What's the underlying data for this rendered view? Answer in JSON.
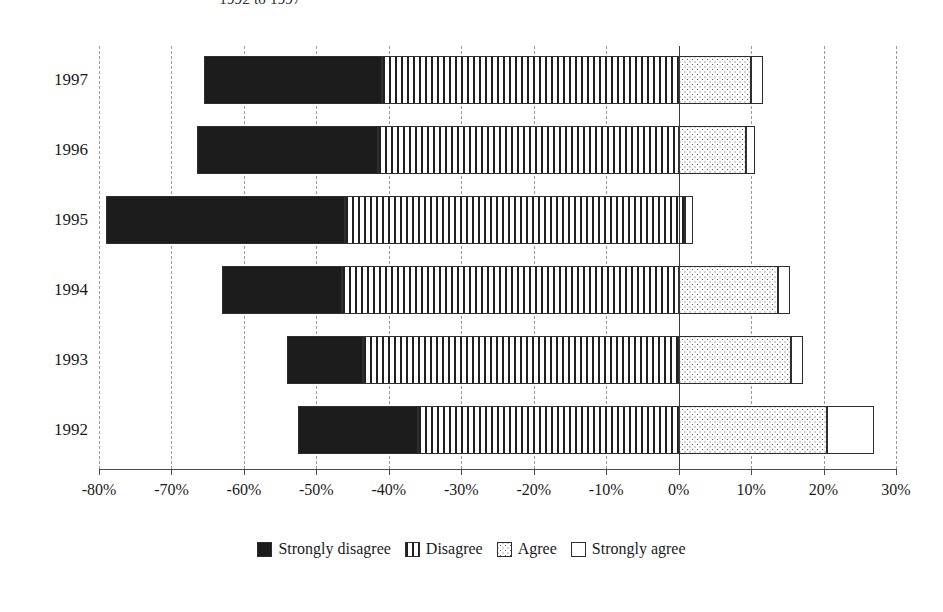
{
  "chart_data": {
    "type": "bar",
    "orientation": "horizontal",
    "stacked": true,
    "diverging": true,
    "title": "1992 to 1997",
    "xlabel": "",
    "ylabel": "",
    "xlim": [
      -80,
      30
    ],
    "xtick_step": 10,
    "grid": true,
    "legend_position": "bottom",
    "categories": [
      "1992",
      "1993",
      "1994",
      "1995",
      "1996",
      "1997"
    ],
    "category_order_top_to_bottom": [
      "1997",
      "1996",
      "1995",
      "1994",
      "1993",
      "1992"
    ],
    "x_tick_labels": [
      "-80%",
      "-70%",
      "-60%",
      "-50%",
      "-40%",
      "-30%",
      "-20%",
      "-10%",
      "0%",
      "10%",
      "20%",
      "30%"
    ],
    "x_tick_values": [
      -80,
      -70,
      -60,
      -50,
      -40,
      -30,
      -20,
      -10,
      0,
      10,
      20,
      30
    ],
    "series": [
      {
        "name": "Strongly disagree",
        "pattern": "solid-black",
        "color": "#1c1c1c",
        "values": [
          -16.5,
          -10.5,
          -16.5,
          -33.0,
          -25.0,
          -24.0
        ]
      },
      {
        "name": "Disagree",
        "pattern": "vertical-stripes",
        "color": "#ffffff",
        "values": [
          -36.0,
          -43.5,
          -46.5,
          -46.0,
          -41.5,
          -41.0
        ]
      },
      {
        "name": "Agree",
        "pattern": "dotted",
        "color": "#fdfdfd",
        "values": [
          20.5,
          15.5,
          13.7,
          0.9,
          9.3,
          10.0
        ]
      },
      {
        "name": "Strongly agree",
        "pattern": "white",
        "color": "#ffffff",
        "values": [
          6.5,
          1.7,
          1.7,
          1.1,
          1.2,
          1.6
        ]
      }
    ],
    "rows": [
      {
        "year": "1997",
        "negative_start": -65.5,
        "strongly_disagree_end": -41.0,
        "disagree_end": 0,
        "agree_end": 10.0,
        "strongly_agree_end": 11.6
      },
      {
        "year": "1996",
        "negative_start": -66.5,
        "strongly_disagree_end": -41.5,
        "disagree_end": 0,
        "agree_end": 9.3,
        "strongly_agree_end": 10.5
      },
      {
        "year": "1995",
        "negative_start": -79.0,
        "strongly_disagree_end": -46.0,
        "disagree_end": 0.9,
        "agree_end": 0.9,
        "strongly_agree_end": 2.0
      },
      {
        "year": "1994",
        "negative_start": -63.0,
        "strongly_disagree_end": -46.5,
        "disagree_end": 0,
        "agree_end": 13.7,
        "strongly_agree_end": 15.4
      },
      {
        "year": "1993",
        "negative_start": -54.0,
        "strongly_disagree_end": -43.5,
        "disagree_end": 0,
        "agree_end": 15.5,
        "strongly_agree_end": 17.2
      },
      {
        "year": "1992",
        "negative_start": -52.5,
        "strongly_disagree_end": -36.0,
        "disagree_end": 0,
        "agree_end": 20.5,
        "strongly_agree_end": 27.0
      }
    ]
  },
  "legend": {
    "items": [
      {
        "label": "Strongly disagree",
        "swatch": "solid-black-swatch"
      },
      {
        "label": "Disagree",
        "swatch": "vertical-stripe-swatch"
      },
      {
        "label": "Agree",
        "swatch": "dotted-swatch"
      },
      {
        "label": "Strongly agree",
        "swatch": "white-swatch"
      }
    ]
  },
  "colors": {
    "strongly_disagree": "#1c1c1c",
    "disagree": "#ffffff",
    "agree": "#fdfdfd",
    "strongly_agree": "#ffffff",
    "axis": "#3a3a3a",
    "grid": "#9a9a9a",
    "text": "#1a1a1a"
  }
}
